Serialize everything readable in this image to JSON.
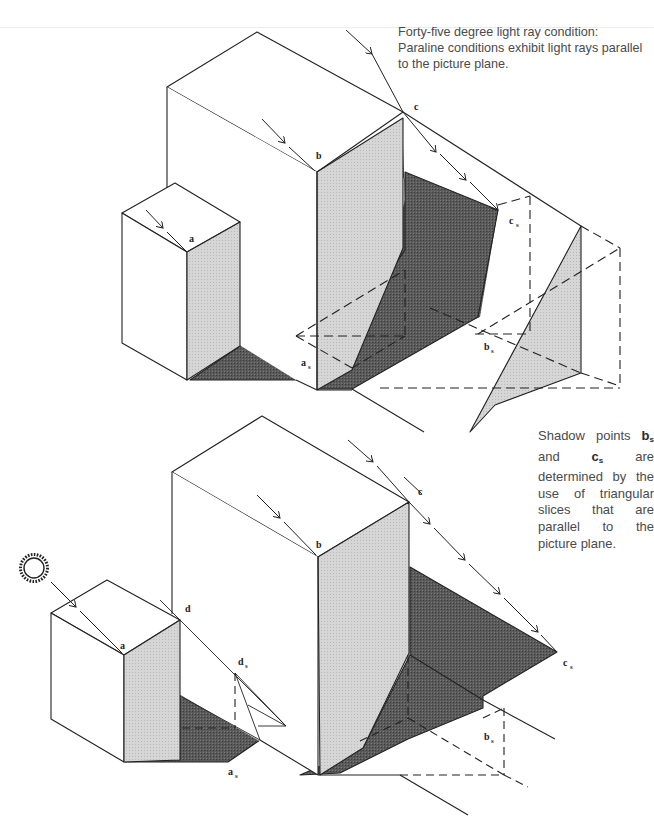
{
  "captions": {
    "top": {
      "line1": "Forty-five degree light ray condition:",
      "line2": "Paraline conditions exhibit light rays parallel",
      "line3": "to the picture plane."
    },
    "side": {
      "t1": "Shadow points ",
      "b": "b",
      "b_sub": "s",
      "t2": " and ",
      "c": "c",
      "c_sub": "s",
      "t3": " are determined by the use of triangular slices that are parallel to the picture plane."
    }
  },
  "top_diagram": {
    "labels": {
      "a": "a",
      "b": "b",
      "c": "c",
      "as": "a",
      "as_sub": "s",
      "bs": "b",
      "bs_sub": "s",
      "cs": "c",
      "cs_sub": "s"
    }
  },
  "bottom_diagram": {
    "labels": {
      "a": "a",
      "b": "b",
      "c": "c",
      "d": "d",
      "ds": "d",
      "ds_sub": "s",
      "as": "a",
      "as_sub": "s",
      "bs": "b",
      "bs_sub": "s",
      "cs": "c",
      "cs_sub": "s"
    },
    "icon": "sun-icon"
  },
  "colors": {
    "light_face": "#cfcfcf",
    "shadow": "#555555",
    "line": "#222222",
    "caption": "#4a4a4a"
  }
}
